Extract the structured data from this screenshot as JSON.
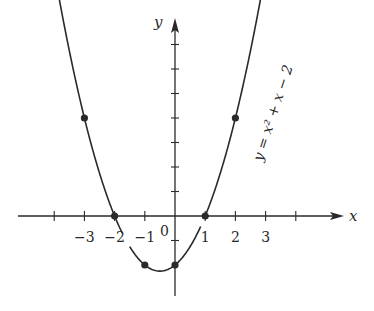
{
  "chart_data": {
    "type": "line",
    "title": "",
    "function_label": "y = x² + x − 2",
    "xlabel": "x",
    "ylabel": "y",
    "origin_label": "0",
    "x_ticks": [
      -4,
      -3,
      -2,
      -1,
      0,
      1,
      2,
      3,
      4
    ],
    "x_tick_labels": [
      {
        "value": -3,
        "text": "−3"
      },
      {
        "value": -2,
        "text": "−2"
      },
      {
        "value": -1,
        "text": "−1"
      },
      {
        "value": 1,
        "text": "1"
      },
      {
        "value": 2,
        "text": "2"
      },
      {
        "value": 3,
        "text": "3"
      }
    ],
    "y_ticks": [
      -1,
      1,
      2,
      3,
      4,
      5,
      6,
      7
    ],
    "xlim": [
      -4.2,
      5.5
    ],
    "ylim": [
      -3.2,
      7.9
    ],
    "grid": false,
    "series": [
      {
        "name": "y = x² + x − 2",
        "curve_x_range_left": [
          -3.9,
          -0.8
        ],
        "curve_x_range_right": [
          -1.5,
          3.1
        ],
        "marked_points": [
          {
            "x": -3,
            "y": 4
          },
          {
            "x": -2,
            "y": 0
          },
          {
            "x": -1,
            "y": -2
          },
          {
            "x": 0,
            "y": -2
          },
          {
            "x": 1,
            "y": 0
          },
          {
            "x": 2,
            "y": 4
          }
        ]
      }
    ],
    "vertex": {
      "x": -0.5,
      "y": -2.25
    }
  },
  "colors": {
    "ink": "#2a2a2a",
    "background": "#ffffff"
  }
}
